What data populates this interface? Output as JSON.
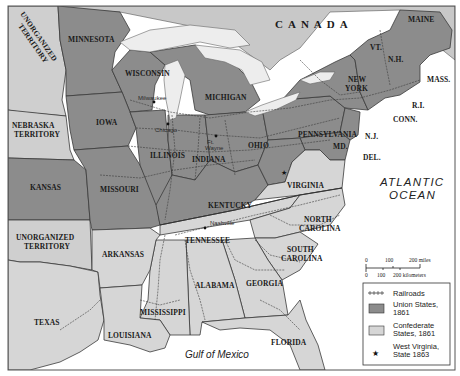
{
  "map": {
    "title": "Union and Confederate States, 1861",
    "colors": {
      "union": "#8c8c8c",
      "confederate": "#d6d6d6",
      "territory": "#cfcfcf",
      "canada": "#c8c8c8",
      "water": "#ffffff",
      "lakes": "#ededed"
    },
    "regions": {
      "canada": "CANADA",
      "atlantic_line1": "ATLANTIC",
      "atlantic_line2": "OCEAN",
      "gulf": "Gulf of Mexico"
    },
    "territories": {
      "unorganized_north_line1": "UNORGANIZED",
      "unorganized_north_line2": "TERRITORY",
      "nebraska_line1": "NEBRASKA",
      "nebraska_line2": "TERRITORY",
      "unorganized_south_line1": "UNORGANIZED",
      "unorganized_south_line2": "TERRITORY"
    },
    "union_states": {
      "minnesota": "MINNESOTA",
      "wisconsin": "WISCONSIN",
      "michigan": "MICHIGAN",
      "iowa": "IOWA",
      "illinois": "ILLINOIS",
      "indiana": "INDIANA",
      "ohio": "OHIO",
      "pennsylvania": "PENNSYLVANIA",
      "new_york_line1": "NEW",
      "new_york_line2": "YORK",
      "vermont": "VT.",
      "new_hampshire": "N.H.",
      "maine": "MAINE",
      "massachusetts": "MASS.",
      "rhode_island": "R.I.",
      "connecticut": "CONN.",
      "new_jersey": "N.J.",
      "maryland": "MD.",
      "delaware": "DEL.",
      "kansas": "KANSAS",
      "missouri": "MISSOURI",
      "kentucky": "KENTUCKY"
    },
    "confederate_states": {
      "virginia": "VIRGINIA",
      "north_carolina_line1": "NORTH",
      "north_carolina_line2": "CAROLINA",
      "south_carolina_line1": "SOUTH",
      "south_carolina_line2": "CAROLINA",
      "tennessee": "TENNESSEE",
      "arkansas": "ARKANSAS",
      "texas": "TEXAS",
      "louisiana": "LOUISIANA",
      "mississippi": "MISSISSIPPI",
      "alabama": "ALABAMA",
      "georgia": "GEORGIA",
      "florida": "FLORIDA"
    },
    "cities": {
      "milwaukee": "Milwaukee",
      "chicago": "Chicago",
      "fort_wayne_line1": "Ft.",
      "fort_wayne_line2": "Wayne",
      "nashville": "Nashville"
    },
    "scale": {
      "miles_labels": [
        "0",
        "100",
        "200 miles"
      ],
      "km_labels": [
        "0",
        "100",
        "200 kilometers"
      ]
    },
    "legend": {
      "items": [
        {
          "symbol": "railroad",
          "label_line1": "Railroads",
          "label_line2": ""
        },
        {
          "symbol": "union-swatch",
          "label_line1": "Union States,",
          "label_line2": "1861"
        },
        {
          "symbol": "confederate-swatch",
          "label_line1": "Confederate",
          "label_line2": "States, 1861"
        },
        {
          "symbol": "star",
          "label_line1": "West Virginia,",
          "label_line2": "State 1863"
        }
      ]
    }
  }
}
